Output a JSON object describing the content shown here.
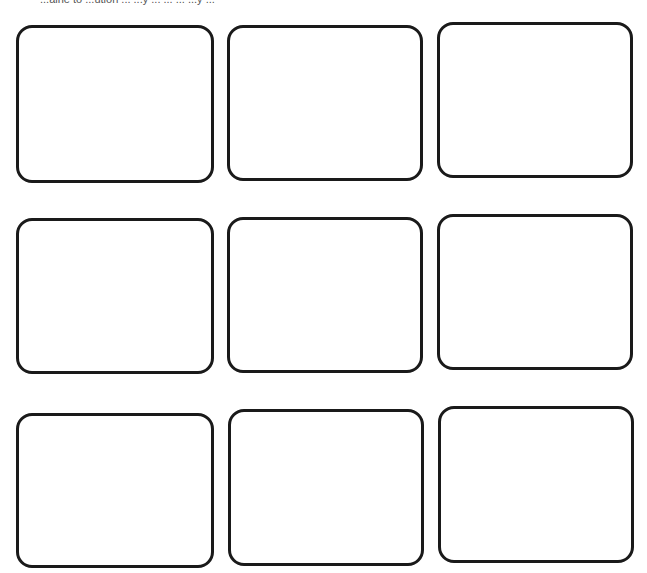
{
  "header": {
    "clipped_instruction_text": "...aine to ...ution ... ...y ... ... ... ...y ..."
  },
  "grid": {
    "rows": 3,
    "columns": 3,
    "border_color": "#1a1a1a",
    "background_color": "#ffffff",
    "cards": [
      {
        "row": 1,
        "col": 1,
        "x": 16,
        "y": 25,
        "w": 198,
        "h": 158
      },
      {
        "row": 1,
        "col": 2,
        "x": 227,
        "y": 25,
        "w": 196,
        "h": 156
      },
      {
        "row": 1,
        "col": 3,
        "x": 437,
        "y": 22,
        "w": 196,
        "h": 156
      },
      {
        "row": 2,
        "col": 1,
        "x": 16,
        "y": 218,
        "w": 198,
        "h": 156
      },
      {
        "row": 2,
        "col": 2,
        "x": 227,
        "y": 217,
        "w": 196,
        "h": 156
      },
      {
        "row": 2,
        "col": 3,
        "x": 437,
        "y": 214,
        "w": 196,
        "h": 156
      },
      {
        "row": 3,
        "col": 1,
        "x": 16,
        "y": 413,
        "w": 198,
        "h": 155
      },
      {
        "row": 3,
        "col": 2,
        "x": 228,
        "y": 409,
        "w": 196,
        "h": 157
      },
      {
        "row": 3,
        "col": 3,
        "x": 438,
        "y": 406,
        "w": 196,
        "h": 157
      }
    ]
  }
}
